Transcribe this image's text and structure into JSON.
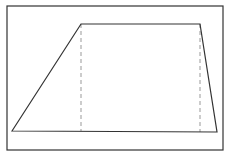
{
  "diagram": {
    "type": "trapezoid",
    "frame": {
      "x": 7,
      "y": 6,
      "width": 216,
      "height": 144,
      "stroke": "#333333"
    },
    "vertices": {
      "bottom_left": [
        12,
        131
      ],
      "top_left": [
        81,
        24
      ],
      "top_right": [
        200,
        24
      ],
      "bottom_right": [
        217,
        132
      ]
    },
    "dashed_lines": [
      {
        "x1": 81,
        "y1": 24,
        "x2": 81,
        "y2": 131
      },
      {
        "x1": 200,
        "y1": 24,
        "x2": 200,
        "y2": 132
      }
    ],
    "stroke_color": "#333333",
    "dash_color": "#999999"
  }
}
